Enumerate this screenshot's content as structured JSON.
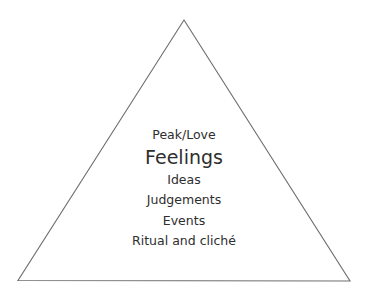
{
  "diagram": {
    "type": "pyramid",
    "stroke_color": "#6e6e6e",
    "text_color": "#2e2e2e",
    "levels": [
      {
        "label": "Peak/Love",
        "emphasis": false
      },
      {
        "label": "Feelings",
        "emphasis": true
      },
      {
        "label": "Ideas",
        "emphasis": false
      },
      {
        "label": "Judgements",
        "emphasis": false
      },
      {
        "label": "Events",
        "emphasis": false
      },
      {
        "label": "Ritual and cliché",
        "emphasis": false
      }
    ]
  }
}
